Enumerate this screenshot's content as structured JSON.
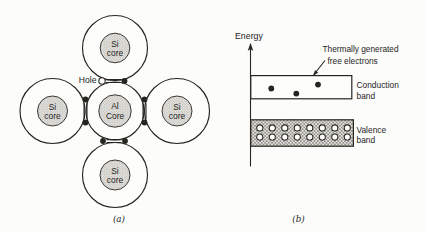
{
  "colors": {
    "ink": "#26251f",
    "paper": "#fcfcfa"
  },
  "panel_a": {
    "caption": "(a)",
    "hole_label": "Hole",
    "atoms": [
      {
        "symbol": "Si",
        "core": "core"
      },
      {
        "symbol": "Si",
        "core": "core"
      },
      {
        "symbol": "Al",
        "core": "Core"
      },
      {
        "symbol": "Si",
        "core": "core"
      },
      {
        "symbol": "Si",
        "core": "core"
      }
    ],
    "bond_electron_count": 7,
    "hole_count": 1
  },
  "panel_b": {
    "caption": "(b)",
    "axis_label": "Energy",
    "annotation": {
      "line1": "Thermally generated",
      "line2": "free electrons"
    },
    "conduction_band": {
      "label_line1": "Conduction",
      "label_line2": "band",
      "electron_count": 3
    },
    "valence_band": {
      "label_line1": "Valence",
      "label_line2": "band",
      "electron_count": 16
    }
  }
}
